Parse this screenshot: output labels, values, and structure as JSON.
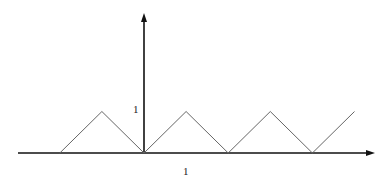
{
  "diagram": {
    "type": "triangle-wave-plot",
    "axes": {
      "x_axis_color": "#111111",
      "y_axis_color": "#111111",
      "x_tick_label": "1",
      "y_tick_label": "1"
    },
    "curve": {
      "color": "#666666",
      "description": "periodic triangle wave with amplitude 1 and period 2",
      "points": [
        [
          -2,
          0
        ],
        [
          -1,
          1
        ],
        [
          0,
          0
        ],
        [
          1,
          1
        ],
        [
          2,
          0
        ],
        [
          3,
          1
        ],
        [
          4,
          0
        ],
        [
          5,
          1
        ]
      ]
    }
  }
}
